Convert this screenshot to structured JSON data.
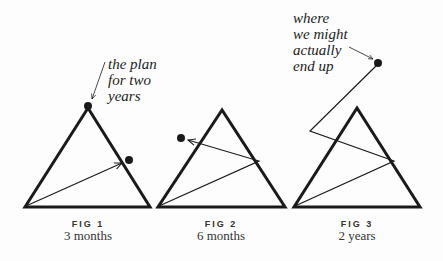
{
  "figures": [
    {
      "number": "FIG 1",
      "caption": "3 months",
      "annotation": [
        "the plan",
        "for two",
        "years"
      ]
    },
    {
      "number": "FIG 2",
      "caption": "6 months"
    },
    {
      "number": "FIG 3",
      "caption": "2 years",
      "annotation": [
        "where",
        "we might",
        "actually",
        "end up"
      ]
    }
  ],
  "colors": {
    "line": "#1a1a1a",
    "background": "#fdfdfd"
  }
}
